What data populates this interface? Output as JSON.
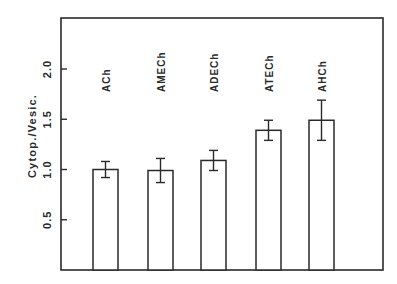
{
  "chart_data": {
    "type": "bar",
    "title": "",
    "xlabel": "",
    "ylabel": "Cytop./Vesic.",
    "categories": [
      "ACh",
      "AMECh",
      "ADECh",
      "ATECh",
      "AHCh"
    ],
    "values": [
      1.0,
      0.99,
      1.09,
      1.39,
      1.49
    ],
    "errors": [
      0.08,
      0.12,
      0.1,
      0.1,
      0.2
    ],
    "ylim": [
      0,
      2.5
    ],
    "yticks": [
      0.5,
      1.0,
      1.5,
      2.0
    ],
    "ytick_labels": [
      "0.5",
      "1.0",
      "1.5",
      "2.0"
    ],
    "grid": false,
    "legend": "none",
    "bar_fill": "#ffffff",
    "line_color": "#2a2a2a",
    "category_labels_position": "inside plot, rotated vertical, above bars"
  }
}
